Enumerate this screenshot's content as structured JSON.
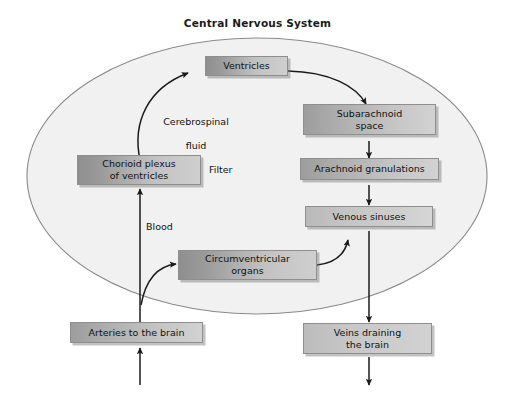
{
  "diagram": {
    "title": "Central Nervous System",
    "boundary_label": "Central Nervous System",
    "colors": {
      "ellipse_fill": "#f1f1f1",
      "ellipse_stroke": "#8a8a8a",
      "box_border": "#8e8e8e",
      "arrow": "#1a1a1a",
      "text": "#111111",
      "background": "#ffffff"
    },
    "nodes": [
      {
        "id": "ventricles",
        "label": "Ventricles",
        "shade": "dark"
      },
      {
        "id": "subarachnoid",
        "label": "Subarachnoid\nspace",
        "shade": "mid"
      },
      {
        "id": "arachnoid",
        "label": "Arachnoid granulations",
        "shade": "mid"
      },
      {
        "id": "venous-sinuses",
        "label": "Venous sinuses",
        "shade": "light"
      },
      {
        "id": "choroid-plexus",
        "label": "Chorioid plexus\nof ventricles",
        "shade": "dark"
      },
      {
        "id": "circumventricular",
        "label": "Circumventricular\norgans",
        "shade": "dark"
      },
      {
        "id": "arteries",
        "label": "Arteries to the brain",
        "shade": "mid"
      },
      {
        "id": "veins",
        "label": "Veins draining\nthe brain",
        "shade": "light"
      }
    ],
    "node_labels": {
      "ventricles": "Ventricles",
      "subarachnoid_line1": "Subarachnoid",
      "subarachnoid_line2": "space",
      "arachnoid": "Arachnoid granulations",
      "venous_sinuses": "Venous sinuses",
      "choroid_line1": "Chorioid plexus",
      "choroid_line2": "of ventricles",
      "circum_line1": "Circumventricular",
      "circum_line2": "organs",
      "arteries": "Arteries to the brain",
      "veins_line1": "Veins draining",
      "veins_line2": "the brain"
    },
    "edge_labels": {
      "cerebrospinal_line1": "Cerebrospinal",
      "cerebrospinal_line2": "fluid",
      "filter": "Filter",
      "blood": "Blood"
    },
    "edges": [
      {
        "from": "choroid-plexus",
        "to": "ventricles",
        "label": "Cerebrospinal fluid",
        "style": "curved"
      },
      {
        "from": "ventricles",
        "to": "subarachnoid",
        "label": "",
        "style": "curved"
      },
      {
        "from": "subarachnoid",
        "to": "arachnoid",
        "label": "",
        "style": "straight"
      },
      {
        "from": "arachnoid",
        "to": "venous-sinuses",
        "label": "",
        "style": "straight"
      },
      {
        "from": "venous-sinuses",
        "to": "veins",
        "label": "",
        "style": "straight"
      },
      {
        "from": "arteries",
        "to": "choroid-plexus",
        "label": "Blood",
        "style": "straight"
      },
      {
        "from": "arteries",
        "to": "circumventricular",
        "label": "",
        "style": "curved"
      },
      {
        "from": "circumventricular",
        "to": "venous-sinuses",
        "label": "",
        "style": "curved"
      },
      {
        "from": "inflow",
        "to": "arteries",
        "label": "",
        "style": "straight"
      },
      {
        "from": "veins",
        "to": "outflow",
        "label": "",
        "style": "straight"
      }
    ]
  }
}
